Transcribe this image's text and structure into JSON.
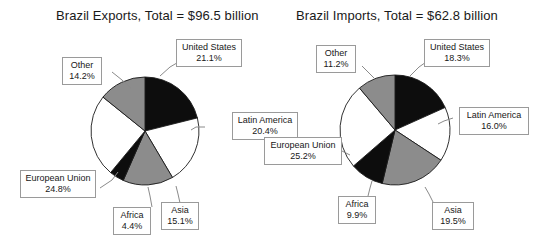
{
  "figure": {
    "background_color": "#ffffff",
    "width": 541,
    "height": 245
  },
  "palette": {
    "black": "#0d0d0d",
    "white": "#ffffff",
    "gray": "#8c8c8c",
    "outline": "#1a1a1a",
    "callout_border": "#9a9a9a",
    "text": "#171717"
  },
  "chart_data": [
    {
      "type": "pie",
      "id": "brazil-exports",
      "title": "Brazil Exports, Total = $96.5 billion",
      "total_label": "Total = $96.5 billion",
      "total_value": 96.5,
      "total_units": "billion USD",
      "categories": [
        "United States",
        "Latin America",
        "Asia",
        "Africa",
        "European Union",
        "Other"
      ],
      "values": [
        21.1,
        20.4,
        15.1,
        4.4,
        24.8,
        14.2
      ],
      "value_labels": [
        "21.1%",
        "20.4%",
        "15.1%",
        "4.4%",
        "24.8%",
        "14.2%"
      ],
      "slice_fills": [
        "black",
        "white",
        "gray",
        "black",
        "white",
        "gray"
      ],
      "start_angle_deg": 0,
      "direction": "clockwise",
      "legend": "none",
      "labels_position": "callout-boxes-with-leader-lines"
    },
    {
      "type": "pie",
      "id": "brazil-imports",
      "title": "Brazil Imports, Total = $62.8 billion",
      "total_label": "Total = $62.8 billion",
      "total_value": 62.8,
      "total_units": "billion USD",
      "categories": [
        "United States",
        "Latin America",
        "Asia",
        "Africa",
        "European Union",
        "Other"
      ],
      "values": [
        18.3,
        16.0,
        19.5,
        9.9,
        25.2,
        11.2
      ],
      "value_labels": [
        "18.3%",
        "16.0%",
        "19.5%",
        "9.9%",
        "25.2%",
        "11.2%"
      ],
      "slice_fills": [
        "black",
        "white",
        "gray",
        "black",
        "white",
        "gray"
      ],
      "start_angle_deg": 0,
      "direction": "clockwise",
      "legend": "none",
      "labels_position": "callout-boxes-with-leader-lines"
    }
  ],
  "exports": {
    "title": "Brazil Exports, Total = $96.5 billion",
    "callouts": {
      "united_states": {
        "label": "United States",
        "value": "21.1%"
      },
      "latin_america": {
        "label": "Latin America",
        "value": "20.4%"
      },
      "asia": {
        "label": "Asia",
        "value": "15.1%"
      },
      "africa": {
        "label": "Africa",
        "value": "4.4%"
      },
      "european_union": {
        "label": "European Union",
        "value": "24.8%"
      },
      "other": {
        "label": "Other",
        "value": "14.2%"
      }
    }
  },
  "imports": {
    "title": "Brazil Imports, Total = $62.8 billion",
    "callouts": {
      "united_states": {
        "label": "United States",
        "value": "18.3%"
      },
      "latin_america": {
        "label": "Latin America",
        "value": "16.0%"
      },
      "asia": {
        "label": "Asia",
        "value": "19.5%"
      },
      "africa": {
        "label": "Africa",
        "value": "9.9%"
      },
      "european_union": {
        "label": "European Union",
        "value": "25.2%"
      },
      "other": {
        "label": "Other",
        "value": "11.2%"
      }
    }
  }
}
